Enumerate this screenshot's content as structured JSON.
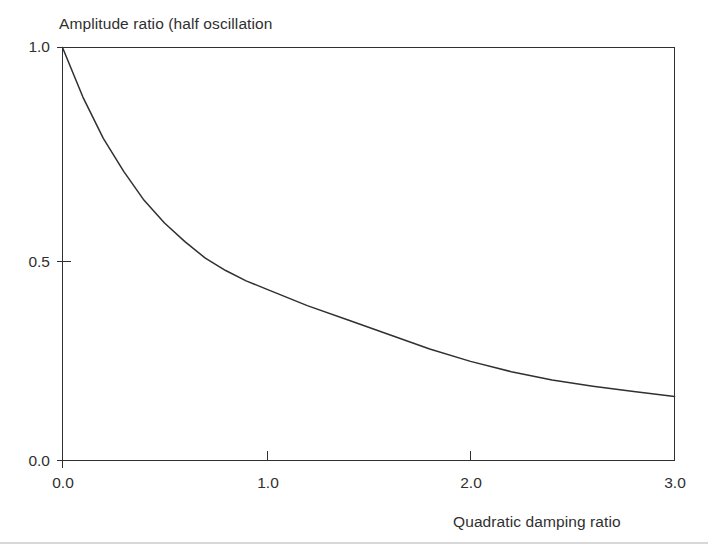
{
  "chart_data": {
    "type": "line",
    "title": "Amplitude ratio (half oscillation",
    "subtitle": "",
    "xlabel": "Quadratic damping ratio",
    "ylabel": "",
    "xlim": [
      0.0,
      3.0
    ],
    "ylim": [
      0.0,
      1.0
    ],
    "grid": false,
    "legend": null,
    "xticks": [
      "0.0",
      "1.0",
      "2.0",
      "3.0"
    ],
    "xtick_values": [
      0.0,
      1.0,
      2.0,
      3.0
    ],
    "yticks": [
      "1.0",
      "0.5",
      "0.0"
    ],
    "ytick_values": [
      1.0,
      0.5,
      0.0
    ],
    "line_color": "#303030",
    "frame_color": "#303030",
    "background_color": "#ffffff",
    "series": [
      {
        "name": "Amplitude ratio",
        "x": [
          0.0,
          0.1,
          0.2,
          0.3,
          0.4,
          0.5,
          0.6,
          0.7,
          0.8,
          0.9,
          1.0,
          1.2,
          1.4,
          1.6,
          1.8,
          2.0,
          2.2,
          2.4,
          2.6,
          2.8,
          3.0
        ],
        "values": [
          1.0,
          0.88,
          0.78,
          0.7,
          0.63,
          0.575,
          0.53,
          0.49,
          0.46,
          0.435,
          0.415,
          0.375,
          0.34,
          0.305,
          0.27,
          0.24,
          0.215,
          0.195,
          0.18,
          0.167,
          0.155
        ]
      }
    ]
  },
  "chart": {
    "title": "Amplitude ratio (half oscillation",
    "xlabel": "Quadratic damping ratio"
  },
  "axis": {
    "y": {
      "labels": [
        "1.0",
        "0.5",
        "0.0"
      ]
    },
    "x": {
      "labels": [
        "0.0",
        "1.0",
        "2.0",
        "3.0"
      ]
    }
  }
}
